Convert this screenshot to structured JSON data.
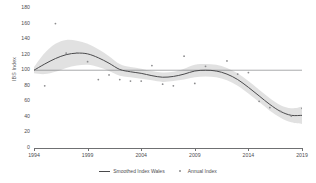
{
  "chart_data": {
    "type": "line",
    "title": "",
    "xlabel": "",
    "ylabel": "IBS Index",
    "xlim": [
      1994,
      2019
    ],
    "ylim": [
      0,
      180
    ],
    "grid": false,
    "legend_position": "bottom-center",
    "y_ticks": [
      180,
      160,
      140,
      120,
      100,
      80,
      60,
      40,
      20,
      0
    ],
    "x_ticks": [
      1994,
      1999,
      2004,
      2009,
      2014,
      2019
    ],
    "reference_line": {
      "value": 100,
      "orientation": "horizontal"
    },
    "series": [
      {
        "name": "Smoothed Index Wales",
        "type": "line",
        "color": "#4a4a4c",
        "x": [
          1994,
          1995,
          1996,
          1997,
          1998,
          1999,
          2000,
          2001,
          2002,
          2003,
          2004,
          2005,
          2006,
          2007,
          2008,
          2009,
          2010,
          2011,
          2012,
          2013,
          2014,
          2015,
          2016,
          2017,
          2018,
          2019
        ],
        "values": [
          100,
          108,
          115,
          120,
          122,
          121,
          116,
          109,
          101,
          98,
          96,
          93,
          91,
          92,
          95,
          99,
          100,
          99,
          95,
          88,
          78,
          67,
          56,
          47,
          42,
          42
        ]
      },
      {
        "name": "Annual Index",
        "type": "scatter",
        "color": "#8c8c8e",
        "x": [
          1995,
          1996,
          1997,
          1998,
          1999,
          2000,
          2001,
          2002,
          2003,
          2004,
          2005,
          2006,
          2007,
          2008,
          2009,
          2010,
          2011,
          2012,
          2013,
          2014,
          2015,
          2016,
          2017,
          2018,
          2019
        ],
        "values": [
          80,
          160,
          122,
          122,
          111,
          88,
          94,
          88,
          86,
          86,
          106,
          82,
          80,
          118,
          83,
          105,
          99,
          112,
          95,
          97,
          60,
          52,
          47,
          41,
          51
        ]
      }
    ],
    "confidence_band": {
      "name": "confidence-interval",
      "color": "#d9d9d9",
      "x": [
        1994,
        1995,
        1996,
        1997,
        1998,
        1999,
        2000,
        2001,
        2002,
        2003,
        2004,
        2005,
        2006,
        2007,
        2008,
        2009,
        2010,
        2011,
        2012,
        2013,
        2014,
        2015,
        2016,
        2017,
        2018,
        2019
      ],
      "upper": [
        104,
        122,
        134,
        139,
        138,
        134,
        127,
        118,
        108,
        104,
        102,
        99,
        97,
        98,
        102,
        107,
        108,
        107,
        103,
        96,
        86,
        75,
        64,
        55,
        51,
        53
      ],
      "lower": [
        96,
        95,
        98,
        103,
        106,
        107,
        104,
        99,
        93,
        91,
        89,
        87,
        85,
        86,
        88,
        91,
        92,
        91,
        87,
        80,
        70,
        59,
        48,
        39,
        33,
        31
      ]
    }
  },
  "legend": {
    "smoothed_label": "Smoothed Index Wales",
    "annual_label": "Annual Index"
  },
  "axes": {
    "y_title": "IBS Index"
  }
}
